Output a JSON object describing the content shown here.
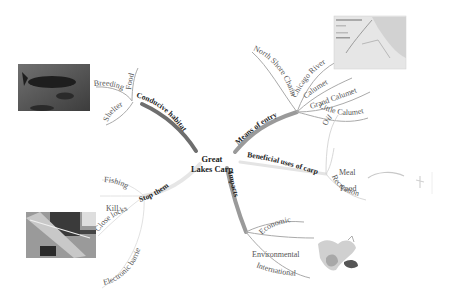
{
  "center": {
    "line1": "Great",
    "line2": "Lakes Carp"
  },
  "branches": [
    {
      "id": "conducive_habitat",
      "label": "Conducive habitat",
      "children": [
        "Breeding",
        "Food",
        "Shelter"
      ],
      "image": "fish-photo"
    },
    {
      "id": "means_of_entry",
      "label": "Means of entry",
      "children": [
        "North Shore Channel",
        "Chicago River",
        "Calumet",
        "Grand Calumet",
        "Little Calumet"
      ],
      "image": "waterway-map"
    },
    {
      "id": "beneficial_uses",
      "label": "Beneficial uses of carp",
      "children": [
        "Oil",
        "Meal",
        "Food",
        "Recreation"
      ],
      "image": "fishing-sketch"
    },
    {
      "id": "impacts",
      "label": "Impacts",
      "children": [
        "Economic",
        "Environmental",
        "International"
      ],
      "image": "great-lakes-map"
    },
    {
      "id": "stop_them",
      "label": "Stop them",
      "children": [
        "Fishing",
        "Kill",
        "Close locks",
        "Electronic barriers"
      ],
      "image": "lock-aerial-photo"
    }
  ],
  "colors": {
    "background": "#ffffff",
    "branch_dark": "#6e6e6e",
    "branch_mid": "#9a9a9a",
    "branch_light": "#d8d8d8",
    "text": "#555555",
    "heading_text": "#222222"
  }
}
